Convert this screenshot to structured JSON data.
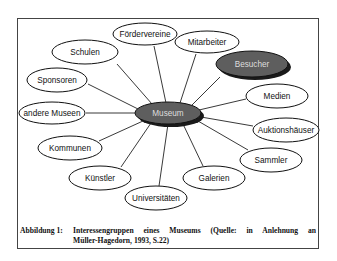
{
  "diagram": {
    "center_node": {
      "label": "Museum",
      "cx": 168,
      "cy": 113,
      "rx": 33,
      "ry": 11,
      "fill": "#5e5e5e",
      "shadow": "#1a1a1a"
    },
    "highlight_node": {
      "label": "Besucher",
      "cx": 252,
      "cy": 64,
      "rx": 36,
      "ry": 13,
      "fill": "#5e5e5e",
      "shadow": "#1a1a1a"
    },
    "nodes": [
      {
        "label": "Fördervereine",
        "cx": 145,
        "cy": 34,
        "rx": 32,
        "ry": 11
      },
      {
        "label": "Mitarbeiter",
        "cx": 207,
        "cy": 42,
        "rx": 32,
        "ry": 11
      },
      {
        "label": "Schulen",
        "cx": 85,
        "cy": 52,
        "rx": 33,
        "ry": 12
      },
      {
        "label": "Sponsoren",
        "cx": 57,
        "cy": 80,
        "rx": 30,
        "ry": 12
      },
      {
        "label": "Medien",
        "cx": 277,
        "cy": 96,
        "rx": 31,
        "ry": 12
      },
      {
        "label": "andere Museen",
        "cx": 52,
        "cy": 113,
        "rx": 33,
        "ry": 11
      },
      {
        "label": "Auktionshäuser",
        "cx": 286,
        "cy": 130,
        "rx": 33,
        "ry": 12
      },
      {
        "label": "Kommunen",
        "cx": 70,
        "cy": 148,
        "rx": 32,
        "ry": 12
      },
      {
        "label": "Sammler",
        "cx": 271,
        "cy": 160,
        "rx": 31,
        "ry": 12
      },
      {
        "label": "Künstler",
        "cx": 100,
        "cy": 178,
        "rx": 31,
        "ry": 12
      },
      {
        "label": "Galerien",
        "cx": 214,
        "cy": 178,
        "rx": 31,
        "ry": 12
      },
      {
        "label": "Universitäten",
        "cx": 156,
        "cy": 198,
        "rx": 31,
        "ry": 12
      }
    ],
    "edges": [
      {
        "to": "Fördervereine",
        "x1": 166,
        "y1": 103,
        "x2": 154,
        "y2": 46
      },
      {
        "to": "Mitarbeiter",
        "x1": 180,
        "y1": 103,
        "x2": 196,
        "y2": 54
      },
      {
        "to": "Schulen",
        "x1": 152,
        "y1": 104,
        "x2": 117,
        "y2": 64
      },
      {
        "to": "Besucher",
        "x1": 191,
        "y1": 106,
        "x2": 220,
        "y2": 77
      },
      {
        "to": "Sponsoren",
        "x1": 138,
        "y1": 109,
        "x2": 88,
        "y2": 84
      },
      {
        "to": "Medien",
        "x1": 199,
        "y1": 110,
        "x2": 246,
        "y2": 99
      },
      {
        "to": "andere Museen",
        "x1": 135,
        "y1": 113,
        "x2": 86,
        "y2": 113
      },
      {
        "to": "Auktionshäuser",
        "x1": 201,
        "y1": 117,
        "x2": 253,
        "y2": 126
      },
      {
        "to": "Kommunen",
        "x1": 143,
        "y1": 121,
        "x2": 99,
        "y2": 141
      },
      {
        "to": "Sammler",
        "x1": 198,
        "y1": 121,
        "x2": 248,
        "y2": 150
      },
      {
        "to": "Künstler",
        "x1": 151,
        "y1": 123,
        "x2": 121,
        "y2": 167
      },
      {
        "to": "Galerien",
        "x1": 183,
        "y1": 124,
        "x2": 203,
        "y2": 166
      },
      {
        "to": "Universitäten",
        "x1": 168,
        "y1": 124,
        "x2": 159,
        "y2": 186
      }
    ]
  },
  "caption": {
    "label": "Abbildung 1:",
    "line1": "Interessengruppen eines Museums (Quelle: in Anlehnung an",
    "line2": "Müller-Hagedorn, 1993, S.22)"
  },
  "colors": {
    "frame_border": "#444444",
    "node_stroke": "#111111",
    "dark_node_fill": "#5e5e5e",
    "shadow": "#1a1a1a"
  }
}
